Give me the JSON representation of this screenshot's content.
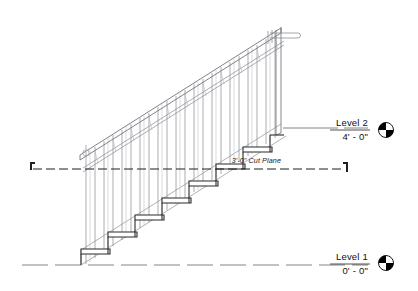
{
  "drawing": {
    "type": "architectural-section",
    "title": "Stair Section with Railing",
    "background_color": "#ffffff",
    "line_colors": {
      "tread_outline": "#2b2b2b",
      "railing": "#7a7d82",
      "stringer": "#9a9da2",
      "level_line": "#555555",
      "cut_plane": "#1f1f1f",
      "text": "#111111",
      "marker_fill": "#000000"
    }
  },
  "levels": [
    {
      "id": "level-2",
      "name": "Level 2",
      "elevation": "4' - 0\"",
      "line_y": 128,
      "line_x_start": 283,
      "line_x_end": 368,
      "marker_cx": 386,
      "marker_cy": 130
    },
    {
      "id": "level-1",
      "name": "Level 1",
      "elevation": "0' - 0\"",
      "line_y": 265,
      "line_x_start": 22,
      "line_x_end": 368,
      "marker_cx": 386,
      "marker_cy": 263
    }
  ],
  "cut_plane": {
    "id": "cut-plane",
    "label": "3'-0\" Cut Plane",
    "line_y": 169,
    "line_x_start": 33,
    "line_x_end": 345,
    "label_x": 281,
    "label_y": 163
  },
  "stair": {
    "riser_count": 8,
    "tread_count": 7,
    "tread_points": [
      {
        "x": 95,
        "y": 249
      },
      {
        "x": 122,
        "y": 232
      },
      {
        "x": 149,
        "y": 215
      },
      {
        "x": 176,
        "y": 198
      },
      {
        "x": 203,
        "y": 181
      },
      {
        "x": 230,
        "y": 164
      },
      {
        "x": 257,
        "y": 147
      }
    ],
    "bottom_x": 81,
    "bottom_y": 265,
    "top_x": 282,
    "top_y": 132
  },
  "railing": {
    "baluster_count": 22,
    "top_rail_label": "sloped-top-rail",
    "has_handrail_extension": true,
    "extension_x_start": 270,
    "extension_x_end": 298,
    "extension_y": 36,
    "newel_circle_x": 86,
    "newel_circle_y": 152
  }
}
